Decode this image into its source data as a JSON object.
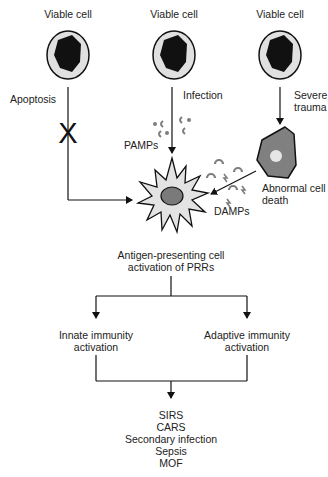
{
  "colors": {
    "line": "#111111",
    "cell_fill": "#e0e0e0",
    "nucleus": "#111111",
    "abnormal_cell_fill": "#808080",
    "abnormal_nucleus": "#e6e6e6",
    "apc_fill": "#e3e3e3",
    "apc_nucleus": "#7a7a7a",
    "molecule": "#7d7d7d"
  },
  "cells": [
    {
      "label": "Viable cell"
    },
    {
      "label": "Viable cell"
    },
    {
      "label": "Viable cell"
    }
  ],
  "paths": {
    "apoptosis": {
      "label": "Apoptosis",
      "blocked_mark": "X"
    },
    "infection": {
      "label": "Infection",
      "molecules_label": "PAMPs"
    },
    "trauma": {
      "label_line1": "Severe",
      "label_line2": "trauma"
    }
  },
  "abnormal_cell": {
    "label_line1": "Abnormal cell",
    "label_line2": "death",
    "molecules_label": "DAMPs"
  },
  "apc": {
    "label_line1": "Antigen-presenting cell",
    "label_line2": "activation of PRRs"
  },
  "branches": {
    "innate": {
      "line1": "Innate immunity",
      "line2": "activation"
    },
    "adaptive": {
      "line1": "Adaptive immunity",
      "line2": "activation"
    }
  },
  "outcomes": [
    "SIRS",
    "CARS",
    "Secondary infection",
    "Sepsis",
    "MOF"
  ]
}
